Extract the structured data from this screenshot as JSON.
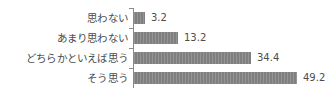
{
  "chart_data": {
    "type": "bar",
    "orientation": "horizontal",
    "title": "",
    "subtitle": "",
    "xlabel": "",
    "ylabel": "",
    "categories": [
      "思わない",
      "あまり思わない",
      "どちらかといえば思う",
      "そう思う"
    ],
    "values": [
      3.2,
      13.2,
      34.4,
      49.2
    ],
    "value_labels": [
      "3.2",
      "13.2",
      "34.4",
      "49.2"
    ],
    "xlim": [
      0,
      60
    ],
    "grid": false,
    "legend": false,
    "legend_position": "none",
    "bar_color": "#7f7f7f",
    "axis_color": "#8a8a8a",
    "label_color": "#4a4a4a",
    "value_color": "#4d4d4d",
    "background": "#ffffff"
  },
  "rows": [
    {
      "category": "思わない",
      "value_label": "3.2",
      "bar_width_px": "11px"
    },
    {
      "category": "あまり思わない",
      "value_label": "13.2",
      "bar_width_px": "44px"
    },
    {
      "category": "どちらかといえば思う",
      "value_label": "34.4",
      "bar_width_px": "117px"
    },
    {
      "category": "そう思う",
      "value_label": "49.2",
      "bar_width_px": "163px"
    }
  ]
}
